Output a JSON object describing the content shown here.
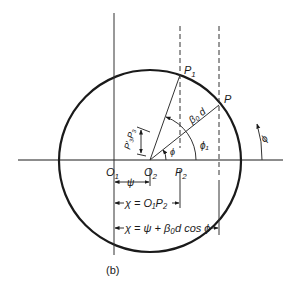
{
  "figure": {
    "caption": "(b)",
    "points": {
      "P1": {
        "main": "P",
        "sub": "1"
      },
      "P": {
        "main": "P"
      },
      "O1": {
        "main": "O",
        "sub": "1"
      },
      "O2": {
        "main": "O",
        "sub": "2"
      },
      "P2": {
        "main": "P",
        "sub": "2"
      }
    },
    "labels": {
      "beta_d": "β₀ d",
      "phi": "ϕ",
      "phi1": "ϕ₁",
      "phi_outer": "ϕ",
      "p3p3": "P′₃P₃",
      "psi": "ψ"
    },
    "dimensions": {
      "psi_label": "ψ",
      "chi_o1p2": "χ = O₁P₂",
      "chi_full": "χ = ψ + β₀d cos ϕ"
    },
    "colors": {
      "stroke": "#1a1a1a",
      "background": "#ffffff"
    }
  }
}
